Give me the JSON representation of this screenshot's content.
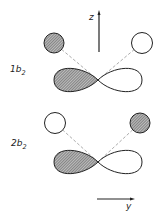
{
  "diagram": {
    "type": "molecular-orbital-diagram",
    "axes": {
      "z_label": "z",
      "y_label": "y"
    },
    "orbitals": [
      {
        "label_main": "1b",
        "label_sub": "2",
        "left_ligand_circle": "shaded",
        "right_ligand_circle": "open",
        "central_p_orbital": {
          "left_lobe": "shaded",
          "right_lobe": "open"
        }
      },
      {
        "label_main": "2b",
        "label_sub": "2",
        "left_ligand_circle": "open",
        "right_ligand_circle": "shaded",
        "central_p_orbital": {
          "left_lobe": "shaded",
          "right_lobe": "open"
        }
      }
    ],
    "colors": {
      "line": "#222222",
      "shade": "#7a7a7a",
      "dashed": "#888888"
    }
  }
}
